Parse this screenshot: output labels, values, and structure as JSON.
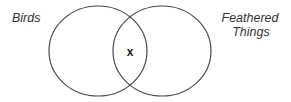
{
  "diagram": {
    "type": "venn",
    "sets": [
      {
        "id": "birds",
        "label": "Birds"
      },
      {
        "id": "feathered",
        "label_lines": [
          "Feathered",
          "Things"
        ]
      }
    ],
    "intersection": {
      "sets": [
        "birds",
        "feathered"
      ],
      "marker": "x"
    },
    "colors": {
      "stroke": "#4a4a4a",
      "text": "#333333",
      "background": "#ffffff"
    }
  }
}
